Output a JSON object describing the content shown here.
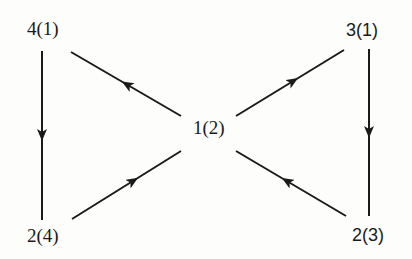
{
  "diagram": {
    "type": "directed-graph",
    "stroke_color": "#1a1a1a",
    "background_color": "#fdfdfc",
    "nodes": [
      {
        "id": "n41",
        "label": "4(1)",
        "x": 27,
        "y": 20
      },
      {
        "id": "n31",
        "label": "3(1)",
        "x": 346,
        "y": 22
      },
      {
        "id": "n12",
        "label": "1(2)",
        "x": 193,
        "y": 119
      },
      {
        "id": "n24",
        "label": "2(4)",
        "x": 27,
        "y": 227
      },
      {
        "id": "n23",
        "label": "2(3)",
        "x": 352,
        "y": 227
      }
    ],
    "edges": [
      {
        "from": "4(1)",
        "to": "2(4)",
        "direction": "down"
      },
      {
        "from": "1(2)",
        "to": "4(1)",
        "direction": "up-left"
      },
      {
        "from": "1(2)",
        "to": "3(1)",
        "direction": "up-right"
      },
      {
        "from": "3(1)",
        "to": "2(3)",
        "direction": "down"
      },
      {
        "from": "2(4)",
        "to": "1(2)",
        "direction": "up-right"
      },
      {
        "from": "2(3)",
        "to": "1(2)",
        "direction": "up-left"
      }
    ]
  }
}
